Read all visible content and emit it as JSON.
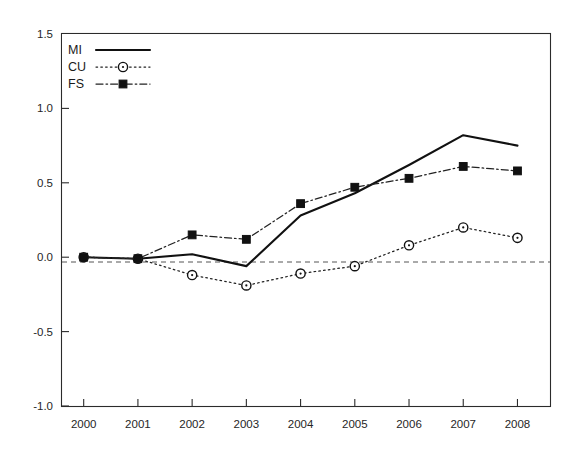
{
  "chart_data": {
    "type": "line",
    "title": "",
    "subtitle": "",
    "xlabel": "",
    "ylabel": "",
    "categories": [
      "2000",
      "2001",
      "2002",
      "2003",
      "2004",
      "2005",
      "2006",
      "2007",
      "2008"
    ],
    "x": [
      2000,
      2001,
      2002,
      2003,
      2004,
      2005,
      2006,
      2007,
      2008
    ],
    "ylim": [
      -1.0,
      1.5
    ],
    "xlim": [
      1999.6,
      2008.6
    ],
    "y_ticks": [
      -1.0,
      -0.5,
      0.0,
      0.5,
      1.0,
      1.5
    ],
    "y_tick_labels": [
      "-1.0",
      "-0.5",
      "0.0",
      "0.5",
      "1.0",
      "1.5"
    ],
    "x_ticks": [
      2000,
      2001,
      2002,
      2003,
      2004,
      2005,
      2006,
      2007,
      2008
    ],
    "x_tick_labels": [
      "2000",
      "2001",
      "2002",
      "2003",
      "2004",
      "2005",
      "2006",
      "2007",
      "2008"
    ],
    "grid": false,
    "zero_reference_line": 0.0,
    "legend_position": "top-left",
    "series": [
      {
        "name": "MI",
        "style": "solid",
        "marker": "none",
        "color": "#111111",
        "values": [
          0.0,
          -0.01,
          0.02,
          -0.06,
          0.28,
          0.43,
          0.62,
          0.82,
          0.75
        ]
      },
      {
        "name": "CU",
        "style": "dotted",
        "marker": "open-circle",
        "color": "#222222",
        "values": [
          0.0,
          -0.01,
          -0.12,
          -0.19,
          -0.11,
          -0.06,
          0.08,
          0.2,
          0.13
        ]
      },
      {
        "name": "FS",
        "style": "dash-dot",
        "marker": "filled-square",
        "color": "#222222",
        "values": [
          0.0,
          -0.01,
          0.15,
          0.12,
          0.36,
          0.47,
          0.53,
          0.61,
          0.58
        ]
      }
    ]
  },
  "legend": {
    "entries": [
      {
        "label": "MI"
      },
      {
        "label": "CU"
      },
      {
        "label": "FS"
      }
    ]
  },
  "colors": {
    "axis": "#2b2b2b",
    "background": "#ffffff",
    "mi": "#111111",
    "cu": "#222222",
    "fs": "#222222"
  }
}
